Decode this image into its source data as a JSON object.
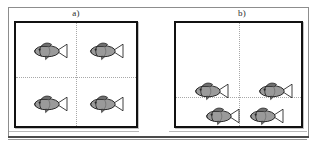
{
  "figure": {
    "background_color": "#ffffff",
    "frame_color": "#8d8d8d",
    "width": 317,
    "height": 150
  },
  "panels": [
    {
      "id": "a",
      "label": "a)",
      "description": "Uniform distribution: one fish in each of the four quadrants",
      "tank": {
        "border_color": "#111111",
        "grid_color": "#a8a8a8",
        "grid_vertical_pct": 50,
        "grid_horizontal_pct": 52,
        "quadrant_counts": [
          1,
          1,
          1,
          1
        ]
      },
      "fish": [
        {
          "name": "fish-a-1",
          "quadrant": "top-left",
          "x_pct": 28,
          "y_pct": 27
        },
        {
          "name": "fish-a-2",
          "quadrant": "top-right",
          "x_pct": 75,
          "y_pct": 27
        },
        {
          "name": "fish-a-3",
          "quadrant": "bottom-left",
          "x_pct": 28,
          "y_pct": 79
        },
        {
          "name": "fish-a-4",
          "quadrant": "bottom-right",
          "x_pct": 75,
          "y_pct": 79
        }
      ]
    },
    {
      "id": "b",
      "label": "b)",
      "description": "Aggregated distribution: all four fish clustered near the lower divider",
      "tank": {
        "border_color": "#111111",
        "grid_color": "#a8a8a8",
        "grid_vertical_pct": 50,
        "grid_horizontal_pct": 72,
        "quadrant_counts": [
          0,
          0,
          2,
          2
        ]
      },
      "fish": [
        {
          "name": "fish-b-1",
          "quadrant": "bottom-left",
          "x_pct": 28,
          "y_pct": 66
        },
        {
          "name": "fish-b-2",
          "quadrant": "bottom-right",
          "x_pct": 79,
          "y_pct": 66
        },
        {
          "name": "fish-b-3",
          "quadrant": "bottom-left",
          "x_pct": 37,
          "y_pct": 90
        },
        {
          "name": "fish-b-4",
          "quadrant": "bottom-right",
          "x_pct": 72,
          "y_pct": 90
        }
      ]
    }
  ],
  "fish_icon": {
    "name": "fish-icon",
    "body_fill": "#9a9a9a",
    "body_stroke": "#2a2a2a",
    "fin_fill": "#6f6f6f",
    "tail_fill": "#ffffff",
    "facing": "left"
  }
}
